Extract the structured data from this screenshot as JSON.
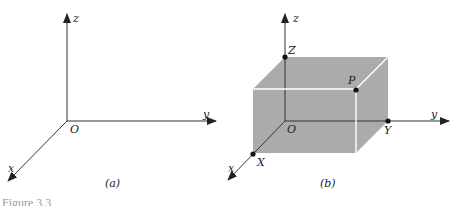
{
  "figure": {
    "caption_partial": "Figure 3.3",
    "panel_a": {
      "label": "(a)",
      "axes": {
        "x": "x",
        "y": "y",
        "z": "z"
      },
      "origin_label": "O"
    },
    "panel_b": {
      "label": "(b)",
      "axes": {
        "x": "x",
        "y": "y",
        "z": "z"
      },
      "origin_label": "O",
      "points": {
        "X": "X",
        "Y": "Y",
        "Z": "Z",
        "P": "P"
      },
      "box_color": "#ababab",
      "edge_color": "#ffffff"
    }
  }
}
